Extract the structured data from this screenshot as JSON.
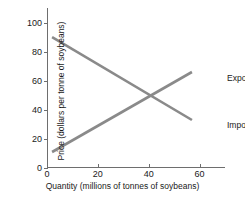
{
  "chart_data": {
    "type": "line",
    "title": "",
    "xlabel": "Quantity (millions of tonnes of soybeans)",
    "ylabel": "Price (dollars per tonne of soybeans)",
    "xlim": [
      0,
      70
    ],
    "ylim": [
      0,
      110
    ],
    "xticks": [
      0,
      20,
      40,
      60
    ],
    "yticks": [
      0,
      20,
      40,
      60,
      80,
      100
    ],
    "xtick_labels": [
      "0",
      "20",
      "40",
      "60"
    ],
    "ytick_labels": [
      "0",
      "20",
      "40",
      "60",
      "80",
      "100"
    ],
    "grid": false,
    "legend_position": "inline-right",
    "line_color": "#8a8a8a",
    "axis_color": "#6e6e6e",
    "series": [
      {
        "name": "Export supply",
        "label": "Export supply",
        "color": "#8a8a8a",
        "points": [
          {
            "x": 2,
            "y": 11
          },
          {
            "x": 57,
            "y": 66
          }
        ]
      },
      {
        "name": "Import demand",
        "label": "Import demand",
        "color": "#8a8a8a",
        "points": [
          {
            "x": 2,
            "y": 90
          },
          {
            "x": 57,
            "y": 33
          }
        ]
      }
    ],
    "equilibrium": {
      "x": 40,
      "y": 48
    }
  }
}
